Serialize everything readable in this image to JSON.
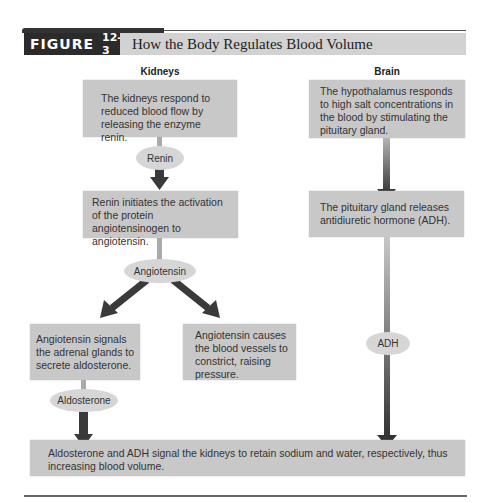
{
  "figure": {
    "label": "FIGURE",
    "number": "12-3",
    "title": "How the Body Regulates Blood Volume"
  },
  "columns": {
    "kidneys": "Kidneys",
    "brain": "Brain"
  },
  "kidneys": {
    "step1": "The kidneys respond to reduced blood flow by releasing the enzyme renin.",
    "renin": "Renin",
    "step2": "Renin initiates the activation of the protein angiotensinogen to angiotensin.",
    "angiotensin": "Angiotensin",
    "step3a": "Angiotensin signals the adrenal glands to secrete aldosterone.",
    "step3b": "Angiotensin causes the blood vessels to constrict, raising pressure.",
    "aldosterone": "Aldosterone"
  },
  "brain": {
    "step1": "The hypothalamus responds to high salt concentrations in the blood by stimulating the pituitary gland.",
    "step2": "The pituitary gland releases antidiuretic hormone (ADH).",
    "adh": "ADH"
  },
  "result": "Aldosterone and ADH signal the kidneys to retain sodium and water, respectively, thus increasing blood volume."
}
